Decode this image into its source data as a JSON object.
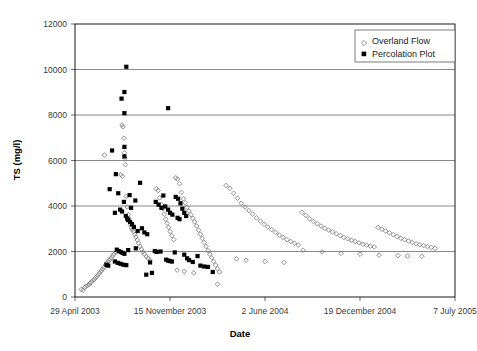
{
  "chart_data": {
    "type": "scatter",
    "title": "",
    "xlabel": "Date",
    "ylabel": "TS (mg/l)",
    "grid": true,
    "legend_position": "top-right",
    "xlim": [
      0,
      800
    ],
    "ylim": [
      0,
      12000
    ],
    "ytick_values": [
      0,
      2000,
      4000,
      6000,
      8000,
      10000,
      12000
    ],
    "ytick_labels": [
      "0",
      "2000",
      "4000",
      "6000",
      "8000",
      "10000",
      "12000"
    ],
    "xtick_values": [
      0,
      200,
      400,
      600,
      800
    ],
    "xtick_labels": [
      "29 April 2003",
      "15 November 2003",
      "2 June 2004",
      "19 December 2004",
      "7 July 2005"
    ],
    "series": [
      {
        "name": "Overland Flow",
        "marker": "open-diamond",
        "color": "#6e6e6e",
        "points": [
          [
            13,
            330
          ],
          [
            17,
            300
          ],
          [
            20,
            420
          ],
          [
            23,
            470
          ],
          [
            27,
            520
          ],
          [
            30,
            560
          ],
          [
            33,
            640
          ],
          [
            36,
            700
          ],
          [
            40,
            760
          ],
          [
            43,
            840
          ],
          [
            46,
            900
          ],
          [
            49,
            980
          ],
          [
            52,
            1060
          ],
          [
            55,
            1140
          ],
          [
            58,
            1220
          ],
          [
            61,
            1300
          ],
          [
            64,
            1400
          ],
          [
            67,
            1500
          ],
          [
            70,
            1560
          ],
          [
            73,
            1640
          ],
          [
            76,
            1720
          ],
          [
            79,
            1800
          ],
          [
            82,
            1880
          ],
          [
            86,
            1960
          ],
          [
            62,
            6240
          ],
          [
            96,
            5380
          ],
          [
            99,
            7560
          ],
          [
            101,
            7480
          ],
          [
            103,
            6980
          ],
          [
            104,
            6340
          ],
          [
            105,
            6100
          ],
          [
            106,
            5820
          ],
          [
            100,
            5300
          ],
          [
            108,
            4420
          ],
          [
            110,
            3960
          ],
          [
            112,
            3620
          ],
          [
            113,
            3460
          ],
          [
            115,
            3320
          ],
          [
            117,
            3180
          ],
          [
            119,
            3040
          ],
          [
            121,
            2960
          ],
          [
            123,
            2880
          ],
          [
            126,
            2760
          ],
          [
            128,
            2640
          ],
          [
            131,
            2500
          ],
          [
            134,
            2360
          ],
          [
            137,
            2220
          ],
          [
            140,
            2100
          ],
          [
            143,
            1980
          ],
          [
            146,
            1880
          ],
          [
            150,
            1780
          ],
          [
            154,
            1700
          ],
          [
            158,
            1620
          ],
          [
            171,
            4760
          ],
          [
            175,
            4680
          ],
          [
            178,
            4360
          ],
          [
            182,
            4060
          ],
          [
            185,
            3880
          ],
          [
            188,
            3640
          ],
          [
            191,
            3420
          ],
          [
            194,
            3240
          ],
          [
            197,
            3060
          ],
          [
            200,
            2880
          ],
          [
            204,
            2700
          ],
          [
            208,
            2520
          ],
          [
            212,
            5240
          ],
          [
            216,
            5180
          ],
          [
            220,
            4980
          ],
          [
            224,
            4600
          ],
          [
            228,
            4320
          ],
          [
            232,
            4140
          ],
          [
            236,
            3940
          ],
          [
            240,
            3780
          ],
          [
            244,
            3620
          ],
          [
            248,
            3460
          ],
          [
            252,
            3300
          ],
          [
            256,
            3120
          ],
          [
            260,
            2940
          ],
          [
            264,
            2760
          ],
          [
            268,
            2580
          ],
          [
            272,
            2400
          ],
          [
            276,
            2220
          ],
          [
            280,
            2040
          ],
          [
            284,
            1880
          ],
          [
            288,
            1720
          ],
          [
            292,
            1560
          ],
          [
            296,
            1400
          ],
          [
            300,
            1240
          ],
          [
            304,
            1100
          ],
          [
            318,
            4900
          ],
          [
            326,
            4780
          ],
          [
            334,
            4560
          ],
          [
            342,
            4340
          ],
          [
            350,
            4120
          ],
          [
            358,
            3960
          ],
          [
            366,
            3800
          ],
          [
            374,
            3640
          ],
          [
            382,
            3480
          ],
          [
            390,
            3340
          ],
          [
            398,
            3200
          ],
          [
            406,
            3080
          ],
          [
            414,
            2960
          ],
          [
            422,
            2840
          ],
          [
            430,
            2720
          ],
          [
            438,
            2620
          ],
          [
            446,
            2520
          ],
          [
            454,
            2440
          ],
          [
            462,
            2360
          ],
          [
            470,
            2280
          ],
          [
            478,
            3720
          ],
          [
            486,
            3580
          ],
          [
            494,
            3440
          ],
          [
            502,
            3320
          ],
          [
            510,
            3220
          ],
          [
            518,
            3120
          ],
          [
            526,
            3020
          ],
          [
            534,
            2940
          ],
          [
            542,
            2860
          ],
          [
            550,
            2780
          ],
          [
            558,
            2700
          ],
          [
            566,
            2620
          ],
          [
            574,
            2560
          ],
          [
            582,
            2500
          ],
          [
            590,
            2440
          ],
          [
            598,
            2380
          ],
          [
            606,
            2320
          ],
          [
            614,
            2280
          ],
          [
            622,
            2240
          ],
          [
            630,
            2200
          ],
          [
            638,
            3060
          ],
          [
            646,
            2980
          ],
          [
            654,
            2900
          ],
          [
            662,
            2820
          ],
          [
            670,
            2740
          ],
          [
            678,
            2660
          ],
          [
            686,
            2580
          ],
          [
            694,
            2520
          ],
          [
            702,
            2460
          ],
          [
            710,
            2400
          ],
          [
            718,
            2340
          ],
          [
            726,
            2300
          ],
          [
            734,
            2260
          ],
          [
            742,
            2220
          ],
          [
            750,
            2180
          ],
          [
            758,
            2140
          ],
          [
            480,
            2060
          ],
          [
            520,
            1980
          ],
          [
            560,
            1920
          ],
          [
            600,
            1880
          ],
          [
            640,
            1840
          ],
          [
            680,
            1820
          ],
          [
            700,
            1800
          ],
          [
            730,
            1790
          ],
          [
            340,
            1680
          ],
          [
            360,
            1620
          ],
          [
            400,
            1560
          ],
          [
            440,
            1520
          ],
          [
            300,
            560
          ],
          [
            215,
            1180
          ],
          [
            230,
            1120
          ],
          [
            250,
            1060
          ]
        ]
      },
      {
        "name": "Percolation Plot",
        "marker": "filled-square",
        "color": "#000000",
        "points": [
          [
            108,
            10120
          ],
          [
            98,
            8720
          ],
          [
            104,
            9010
          ],
          [
            104,
            8080
          ],
          [
            196,
            8300
          ],
          [
            78,
            6440
          ],
          [
            104,
            6600
          ],
          [
            104,
            6180
          ],
          [
            86,
            5400
          ],
          [
            73,
            4740
          ],
          [
            91,
            4560
          ],
          [
            115,
            4480
          ],
          [
            127,
            4240
          ],
          [
            137,
            5020
          ],
          [
            103,
            4180
          ],
          [
            118,
            3920
          ],
          [
            95,
            3840
          ],
          [
            99,
            3760
          ],
          [
            84,
            3700
          ],
          [
            107,
            3560
          ],
          [
            110,
            3440
          ],
          [
            112,
            3380
          ],
          [
            116,
            3300
          ],
          [
            120,
            3200
          ],
          [
            124,
            3080
          ],
          [
            132,
            2900
          ],
          [
            88,
            2080
          ],
          [
            92,
            2020
          ],
          [
            96,
            1980
          ],
          [
            100,
            1940
          ],
          [
            104,
            1900
          ],
          [
            84,
            1560
          ],
          [
            90,
            1500
          ],
          [
            96,
            1460
          ],
          [
            102,
            1420
          ],
          [
            108,
            1400
          ],
          [
            66,
            1420
          ],
          [
            70,
            1380
          ],
          [
            112,
            2060
          ],
          [
            128,
            2140
          ],
          [
            141,
            3020
          ],
          [
            146,
            2840
          ],
          [
            152,
            2760
          ],
          [
            158,
            1520
          ],
          [
            170,
            4180
          ],
          [
            176,
            4060
          ],
          [
            182,
            3920
          ],
          [
            186,
            4460
          ],
          [
            190,
            3980
          ],
          [
            196,
            3840
          ],
          [
            200,
            3700
          ],
          [
            205,
            3620
          ],
          [
            212,
            4400
          ],
          [
            217,
            4320
          ],
          [
            222,
            4120
          ],
          [
            226,
            3880
          ],
          [
            230,
            3700
          ],
          [
            234,
            3560
          ],
          [
            216,
            3480
          ],
          [
            220,
            3420
          ],
          [
            168,
            2020
          ],
          [
            172,
            1980
          ],
          [
            180,
            2000
          ],
          [
            210,
            1960
          ],
          [
            192,
            1640
          ],
          [
            196,
            1600
          ],
          [
            200,
            1580
          ],
          [
            204,
            1560
          ],
          [
            230,
            1860
          ],
          [
            236,
            1700
          ],
          [
            240,
            1620
          ],
          [
            248,
            1540
          ],
          [
            258,
            1800
          ],
          [
            264,
            1380
          ],
          [
            272,
            1340
          ],
          [
            280,
            1320
          ],
          [
            290,
            1100
          ],
          [
            150,
            980
          ],
          [
            162,
            1060
          ]
        ]
      }
    ]
  },
  "legend": {
    "entries": [
      {
        "label": "Overland Flow",
        "marker": "open-diamond"
      },
      {
        "label": "Percolation Plot",
        "marker": "filled-square"
      }
    ]
  }
}
